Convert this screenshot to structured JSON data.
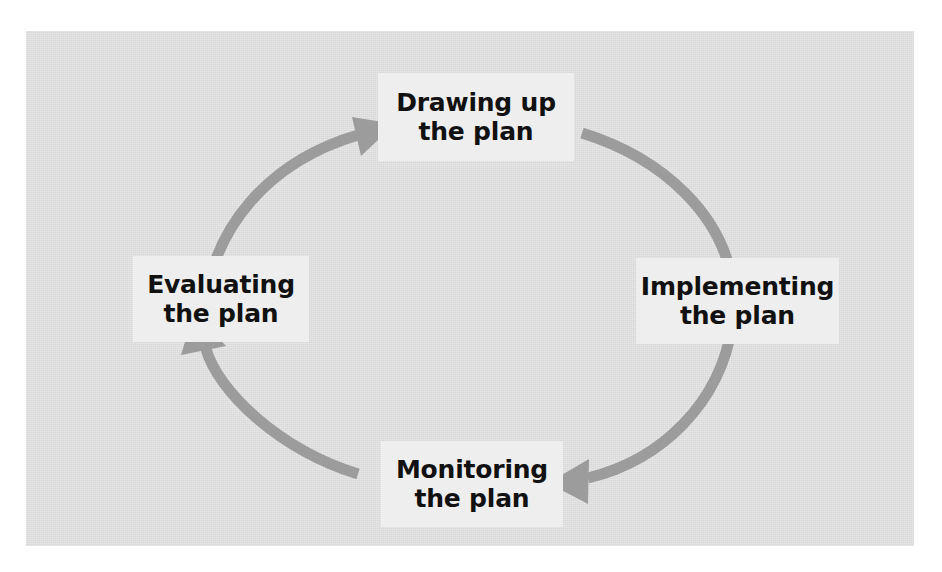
{
  "diagram": {
    "panel_color": "#d8d8d8",
    "box_color": "#eeeeee",
    "arrow_color": "#9c9c9c",
    "text_color": "#111111",
    "direction": "clockwise",
    "nodes": [
      {
        "id": "drawing-up",
        "line1": "Drawing up",
        "line2": "the plan"
      },
      {
        "id": "implementing",
        "line1": "Implementing",
        "line2": "the plan"
      },
      {
        "id": "monitoring",
        "line1": "Monitoring",
        "line2": "the plan"
      },
      {
        "id": "evaluating",
        "line1": "Evaluating",
        "line2": "the plan"
      }
    ],
    "arrows": [
      {
        "id": "eval-to-drawing",
        "from": "evaluating",
        "to": "drawing-up"
      },
      {
        "id": "drawing-to-implementing",
        "from": "drawing-up",
        "to": "implementing"
      },
      {
        "id": "implementing-to-monitoring",
        "from": "implementing",
        "to": "monitoring"
      },
      {
        "id": "monitoring-to-evaluating",
        "from": "monitoring",
        "to": "evaluating"
      }
    ],
    "caption": ""
  }
}
